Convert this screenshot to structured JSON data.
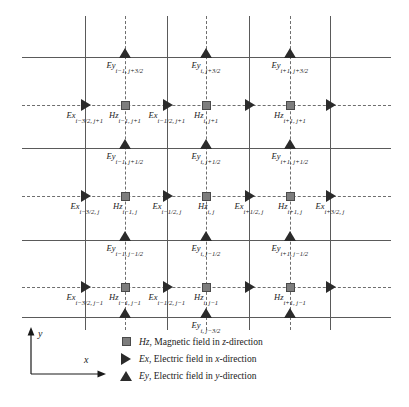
{
  "figure": {
    "title": "",
    "type": "yee-grid-diagram"
  },
  "chart_data": {
    "type": "diagram",
    "title": "",
    "xlabel": "x",
    "ylabel": "y",
    "grid": "on",
    "grid_lines": {
      "vertical_solid_x": [
        85,
        167,
        249,
        330
      ],
      "vertical_dashed_x": [
        125,
        206,
        290
      ],
      "horizontal_solid_y": [
        57,
        148,
        240,
        317
      ],
      "horizontal_dashed_y": [
        105,
        196,
        287
      ]
    },
    "markers": [
      {
        "type": "Ey",
        "x": 125,
        "y": 57,
        "label": "Ey",
        "sub": "i−1, j+3/2"
      },
      {
        "type": "Ey",
        "x": 206,
        "y": 57,
        "label": "Ey",
        "sub": "i, j+3/2"
      },
      {
        "type": "Ey",
        "x": 290,
        "y": 57,
        "label": "Ey",
        "sub": "i+1, j+3/2"
      },
      {
        "type": "Ex",
        "x": 85,
        "y": 105,
        "label": "Ex",
        "sub": "i−3/2, j+1"
      },
      {
        "type": "Hz",
        "x": 125,
        "y": 105,
        "label": "Hz",
        "sub": "i−1, j+1"
      },
      {
        "type": "Ex",
        "x": 167,
        "y": 105,
        "label": "Ex",
        "sub": "i−1/2, j+1"
      },
      {
        "type": "Hz",
        "x": 206,
        "y": 105,
        "label": "Hz",
        "sub": "i, j+1"
      },
      {
        "type": "Ex",
        "x": 249,
        "y": 105,
        "label": "",
        "sub": ""
      },
      {
        "type": "Hz",
        "x": 290,
        "y": 105,
        "label": "Hz",
        "sub": "i+1, j+1"
      },
      {
        "type": "Ex",
        "x": 330,
        "y": 105,
        "label": "",
        "sub": ""
      },
      {
        "type": "Ey",
        "x": 125,
        "y": 148,
        "label": "Ey",
        "sub": "i−1, j+1/2"
      },
      {
        "type": "Ey",
        "x": 206,
        "y": 148,
        "label": "Ey",
        "sub": "i, j+1/2"
      },
      {
        "type": "Ey",
        "x": 290,
        "y": 148,
        "label": "Ey",
        "sub": "i+1, j+1/2"
      },
      {
        "type": "Ex",
        "x": 85,
        "y": 196,
        "label": "Ex",
        "sub": "i−3/2, j"
      },
      {
        "type": "Hz",
        "x": 125,
        "y": 196,
        "label": "Hz",
        "sub": "i−1, j"
      },
      {
        "type": "Ex",
        "x": 167,
        "y": 196,
        "label": "Ex",
        "sub": "i−1/2, j"
      },
      {
        "type": "Hz",
        "x": 206,
        "y": 196,
        "label": "Hz",
        "sub": "i, j"
      },
      {
        "type": "Ex",
        "x": 249,
        "y": 196,
        "label": "Ex",
        "sub": "i+1/2, j"
      },
      {
        "type": "Hz",
        "x": 290,
        "y": 196,
        "label": "Hz",
        "sub": "i+1, j"
      },
      {
        "type": "Ex",
        "x": 330,
        "y": 196,
        "label": "Ex",
        "sub": "i+3/2, j"
      },
      {
        "type": "Ey",
        "x": 125,
        "y": 240,
        "label": "Ey",
        "sub": "i−1, j−1/2"
      },
      {
        "type": "Ey",
        "x": 206,
        "y": 240,
        "label": "Ey",
        "sub": "i, j−1/2"
      },
      {
        "type": "Ey",
        "x": 290,
        "y": 240,
        "label": "Ey",
        "sub": "i+1, j−1/2"
      },
      {
        "type": "Ex",
        "x": 85,
        "y": 287,
        "label": "Ex",
        "sub": "i−3/2, j−1"
      },
      {
        "type": "Hz",
        "x": 125,
        "y": 287,
        "label": "Hz",
        "sub": "i−1, j−1"
      },
      {
        "type": "Ex",
        "x": 167,
        "y": 287,
        "label": "Ex",
        "sub": "i−1/2, j−1"
      },
      {
        "type": "Hz",
        "x": 206,
        "y": 287,
        "label": "Hz",
        "sub": "i, j−1"
      },
      {
        "type": "Ex",
        "x": 249,
        "y": 287,
        "label": "",
        "sub": ""
      },
      {
        "type": "Hz",
        "x": 290,
        "y": 287,
        "label": "Hz",
        "sub": "i+1, j−1"
      },
      {
        "type": "Ex",
        "x": 330,
        "y": 287,
        "label": "",
        "sub": ""
      },
      {
        "type": "Ey",
        "x": 125,
        "y": 317,
        "label": "",
        "sub": ""
      },
      {
        "type": "Ey",
        "x": 206,
        "y": 317,
        "label": "Ey",
        "sub": "i, j−3/2"
      },
      {
        "type": "Ey",
        "x": 290,
        "y": 317,
        "label": "",
        "sub": ""
      }
    ]
  },
  "axes": {
    "y_label": "y",
    "x_label": "x"
  },
  "legend": {
    "items": [
      {
        "icon": "square-marker-icon",
        "symbol": "Hz",
        "text": ", Magnetic field in ",
        "dir": "z",
        "suffix": "-direction"
      },
      {
        "icon": "right-triangle-marker-icon",
        "symbol": "Ex",
        "text": ", Electric field in ",
        "dir": "x",
        "suffix": "-direction"
      },
      {
        "icon": "up-triangle-marker-icon",
        "symbol": "Ey",
        "text": ", Electric field in ",
        "dir": "y",
        "suffix": "-direction"
      }
    ]
  },
  "colors": {
    "hz_fill": "#7d7d7d",
    "hz_stroke": "#4a4a4a",
    "e_fill": "#2b2b2b",
    "grid_solid": "#5a5a5a",
    "grid_dashed": "#6e6e6e",
    "background": "#ffffff"
  }
}
